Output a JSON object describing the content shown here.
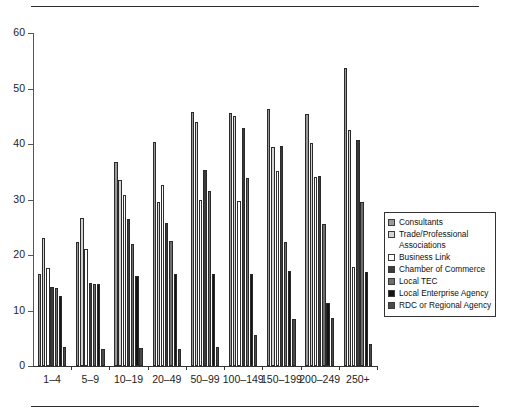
{
  "chart_data": {
    "type": "bar",
    "title": "",
    "subtitle": "",
    "xlabel": "",
    "ylabel": "",
    "ylim": [
      0,
      60
    ],
    "yticks": [
      0,
      10,
      20,
      30,
      40,
      50,
      60
    ],
    "grid": false,
    "legend_position": "right",
    "categories": [
      "1–4",
      "5–9",
      "10–19",
      "20–49",
      "50–99",
      "100–149",
      "150–199",
      "200–249",
      "250+"
    ],
    "series": [
      {
        "name": "Consultants",
        "color": "#9a9a9a",
        "values": [
          16.6,
          22.4,
          36.8,
          40.4,
          45.8,
          45.5,
          46.3,
          45.4,
          53.7
        ]
      },
      {
        "name": "Trade/Professional Associations",
        "color": "#d4d4d4",
        "values": [
          23.1,
          26.7,
          33.6,
          29.6,
          44.0,
          45.0,
          39.4,
          40.1,
          42.5
        ]
      },
      {
        "name": "Business Link",
        "color": "#ffffff",
        "values": [
          17.7,
          21.1,
          30.9,
          32.6,
          30.0,
          29.7,
          35.2,
          34.1,
          17.9
        ]
      },
      {
        "name": "Chamber of Commerce",
        "color": "#3b3b3b",
        "values": [
          14.2,
          14.9,
          26.5,
          25.7,
          35.3,
          42.8,
          39.6,
          34.3,
          40.7
        ]
      },
      {
        "name": "Local TEC",
        "color": "#6e6e6e",
        "values": [
          14.0,
          14.8,
          22.0,
          22.6,
          31.5,
          33.9,
          22.4,
          25.6,
          29.5
        ]
      },
      {
        "name": "Local Enterprise Agency",
        "color": "#141414",
        "values": [
          12.6,
          14.8,
          16.3,
          16.5,
          16.6,
          16.5,
          17.2,
          11.4,
          16.9
        ]
      },
      {
        "name": "RDC or Regional Agency",
        "color": "#4a4a4a",
        "values": [
          3.5,
          3.1,
          3.2,
          3.1,
          3.5,
          5.5,
          8.5,
          8.6,
          3.9
        ]
      }
    ]
  },
  "legend": {
    "items": [
      {
        "label": "Consultants"
      },
      {
        "label": "Trade/Professional\nAssociations"
      },
      {
        "label": "Business Link"
      },
      {
        "label": "Chamber of Commerce"
      },
      {
        "label": "Local TEC"
      },
      {
        "label": "Local Enterprise Agency"
      },
      {
        "label": "RDC or Regional Agency"
      }
    ]
  }
}
